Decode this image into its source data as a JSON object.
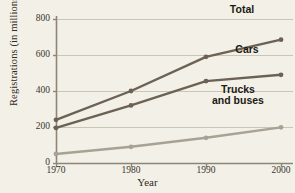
{
  "chart_data": {
    "type": "line",
    "title": "",
    "xlabel": "Year",
    "ylabel": "Registrations (in millions)",
    "x": [
      1970,
      1980,
      1990,
      2000
    ],
    "xticklabels": [
      "1970",
      "1980",
      "1990",
      "2000"
    ],
    "yticks": [
      0,
      200,
      400,
      600,
      800
    ],
    "yticklabels": [
      "0",
      "200",
      "400",
      "600",
      "800"
    ],
    "ylim": [
      0,
      800
    ],
    "xlim": [
      1970,
      2000
    ],
    "grid": "horizontal",
    "legend_position": "inline-right",
    "series": [
      {
        "name": "Total",
        "label": "Total",
        "color": "#6b6154",
        "marker": "circle",
        "values": [
          240,
          400,
          590,
          685
        ]
      },
      {
        "name": "Cars",
        "label": "Cars",
        "color": "#6b6154",
        "marker": "circle",
        "values": [
          195,
          320,
          455,
          490
        ]
      },
      {
        "name": "Trucks and buses",
        "label_line1": "Trucks",
        "label_line2": "and buses",
        "color": "#a9a194",
        "marker": "circle",
        "values": [
          50,
          90,
          140,
          198
        ]
      }
    ]
  },
  "style": {
    "background": "#f2f0e7",
    "gridline_color": "#c9c6b8",
    "axis_color": "#8d8678",
    "text_color": "#2e2a24"
  }
}
